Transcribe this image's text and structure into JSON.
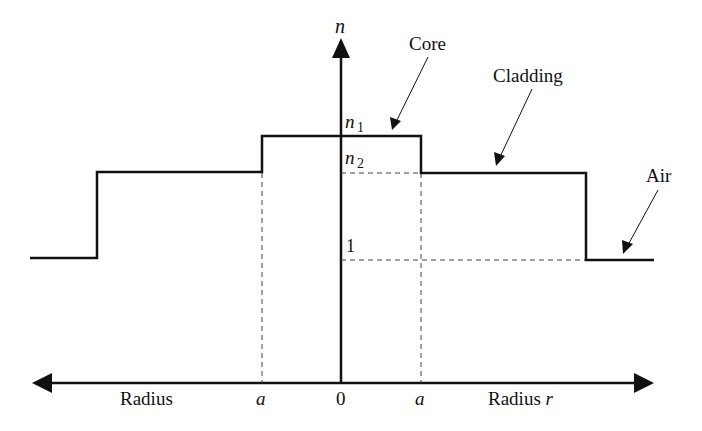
{
  "diagram": {
    "type": "step-index refractive index profile",
    "axes": {
      "vertical_label": "n",
      "horizontal_left_label": "Radius",
      "horizontal_right_label": "Radius",
      "horizontal_right_var": "r",
      "origin_label": "0",
      "core_edge_left_label": "a",
      "core_edge_right_label": "a"
    },
    "levels": {
      "n1": {
        "symbol": "n",
        "sub": "1"
      },
      "n2": {
        "symbol": "n",
        "sub": "2"
      },
      "one": "1"
    },
    "annotations": {
      "core": "Core",
      "cladding": "Cladding",
      "air": "Air"
    },
    "colors": {
      "line": "#111111",
      "dashed": "#444444",
      "background": "#ffffff"
    }
  }
}
